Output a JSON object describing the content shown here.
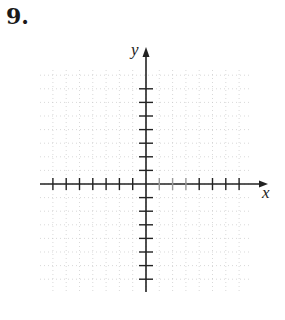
{
  "problem": {
    "number_label": "9."
  },
  "graph": {
    "x_axis_label": "x",
    "y_axis_label": "y",
    "ticks_per_side": 7,
    "grid_lines_each_side": 8,
    "axis_color": "#222222",
    "grid_color": "#c8c8c8"
  },
  "chart_data": {
    "type": "scatter",
    "title": "",
    "xlabel": "x",
    "ylabel": "y",
    "xlim": [
      -8,
      8
    ],
    "ylim": [
      -8,
      8
    ],
    "grid": true,
    "x_ticks": [
      -7,
      -6,
      -5,
      -4,
      -3,
      -2,
      -1,
      1,
      2,
      3,
      4,
      5,
      6,
      7
    ],
    "y_ticks": [
      -7,
      -6,
      -5,
      -4,
      -3,
      -2,
      -1,
      1,
      2,
      3,
      4,
      5,
      6,
      7
    ],
    "series": []
  }
}
